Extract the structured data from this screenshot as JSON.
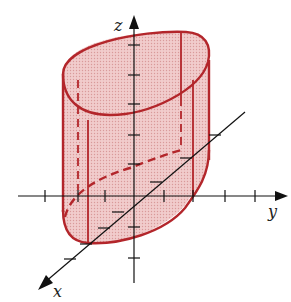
{
  "figure": {
    "axes": {
      "x_label": "x",
      "y_label": "y",
      "z_label": "z"
    },
    "colors": {
      "surface_fill": "#e8b4b4",
      "surface_edge": "#b3262b",
      "axis": "#111111",
      "background": "#ffffff"
    }
  }
}
